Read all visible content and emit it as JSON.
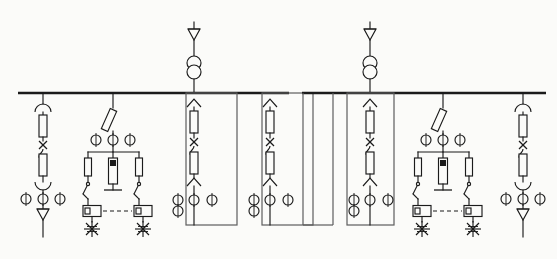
{
  "diagram": {
    "type": "single-line-diagram",
    "colors": {
      "line": "#1b1b1b",
      "cubicle": "#5d5d5d",
      "background": "#fbfbf9"
    },
    "sections": [
      {
        "id": "section-left",
        "name": "Left busbar section",
        "busbar": {
          "x1": 18,
          "x2": 289,
          "y": 93
        },
        "incomer": {
          "name": "incoming-transformer-feeder",
          "tap_x": 194,
          "symbols": [
            "surge-arrester-triangle",
            "two-winding-transformer",
            "truck-chevron"
          ]
        },
        "bays": [
          {
            "id": "bay-L1",
            "name": "line-feeder-with-arrester",
            "tap_x": 43,
            "kind": "feeder-arc",
            "cts": 3,
            "end": "arrester"
          },
          {
            "id": "bay-L2",
            "name": "vt-metering-compartment",
            "tap_x": 113,
            "kind": "vt-metering",
            "cts": 3,
            "fuses": 2,
            "lamps": 2
          },
          {
            "id": "bay-L3",
            "name": "outgoing-feeder-cubicle-1",
            "tap_x": 194,
            "kind": "feeder-cubicle",
            "cts": 4
          },
          {
            "id": "bay-L4",
            "name": "outgoing-feeder-cubicle-2",
            "tap_x": 270,
            "kind": "feeder-cubicle",
            "cts": 4
          }
        ]
      },
      {
        "id": "section-right",
        "name": "Right busbar section",
        "busbar": {
          "x1": 302,
          "x2": 546,
          "y": 93
        },
        "incomer": {
          "name": "incoming-transformer-feeder",
          "tap_x": 370,
          "symbols": [
            "surge-arrester-triangle",
            "two-winding-transformer",
            "truck-chevron"
          ]
        },
        "bays": [
          {
            "id": "bay-R1",
            "name": "outgoing-feeder-cubicle-3",
            "tap_x": 303,
            "kind": "feeder-cubicle-partial",
            "cts": 0
          },
          {
            "id": "bay-R2",
            "name": "outgoing-feeder-cubicle-4",
            "tap_x": 333,
            "kind": "feeder-cubicle-partial",
            "cts": 0
          },
          {
            "id": "bay-R3",
            "name": "outgoing-feeder-cubicle-5",
            "tap_x": 370,
            "kind": "feeder-cubicle",
            "cts": 4
          },
          {
            "id": "bay-R4",
            "name": "vt-metering-compartment",
            "tap_x": 443,
            "kind": "vt-metering",
            "cts": 3,
            "fuses": 2,
            "lamps": 2
          },
          {
            "id": "bay-R5",
            "name": "line-feeder-with-arrester",
            "tap_x": 523,
            "kind": "feeder-arc",
            "cts": 3,
            "end": "arrester"
          }
        ]
      }
    ],
    "legend": {
      "arrester": "surge-arrester",
      "transformer": "two-winding-transformer",
      "ct": "current-transformer",
      "fuse": "fuse",
      "breaker": "circuit-breaker",
      "disconnector": "disconnector-switch",
      "earth": "earthing-switch",
      "lamp": "indicator-lamp"
    }
  }
}
